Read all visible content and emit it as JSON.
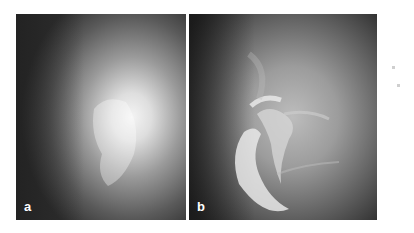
{
  "figure": {
    "panels": [
      {
        "id": "a",
        "label": "a",
        "description": "fluoroscopic image, diffuse bright region center-right"
      },
      {
        "id": "b",
        "label": "b",
        "description": "fluoroscopic image with contrast-filled tubular structures"
      }
    ],
    "colors": {
      "background": "#ffffff",
      "label_text": "#ffffff"
    }
  }
}
